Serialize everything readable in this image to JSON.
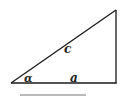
{
  "diagram": {
    "type": "right-triangle",
    "vertices": {
      "bottom_left": [
        11,
        83
      ],
      "bottom_right": [
        116,
        83
      ],
      "top_right": [
        116,
        10
      ]
    },
    "labels": {
      "hypotenuse": "c",
      "adjacent_side": "a",
      "angle": "α"
    },
    "underline": {
      "x1": 20,
      "x2": 86,
      "y": 95
    },
    "colors": {
      "stroke": "#1a1a1a",
      "underline": "#777777",
      "background": "#ffffff"
    }
  }
}
